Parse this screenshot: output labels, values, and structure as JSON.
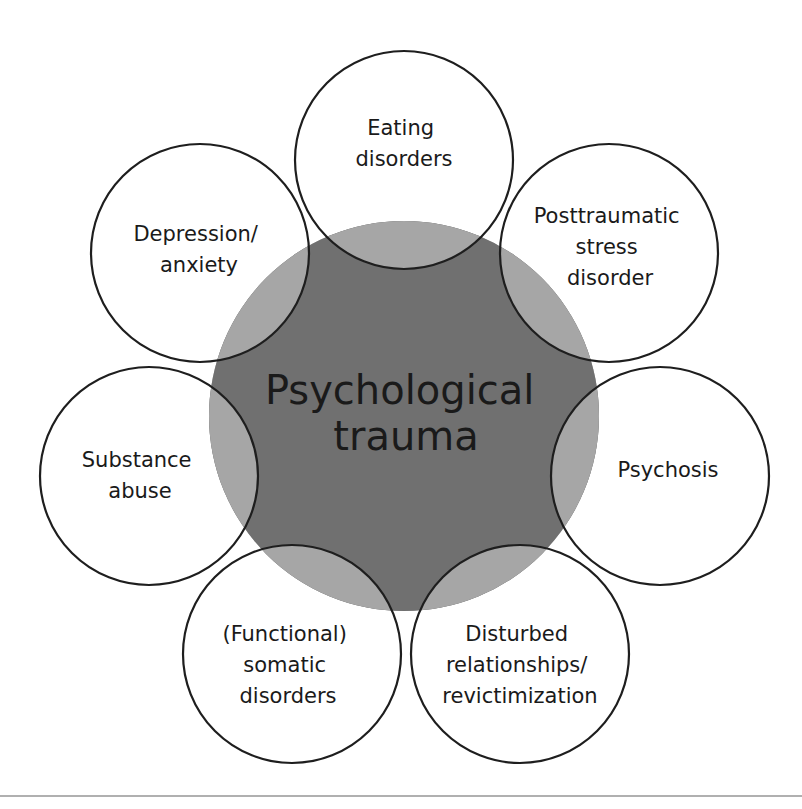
{
  "colors": {
    "background": "#ffffff",
    "core_dark": "#707070",
    "core_light": "#a6a6a6",
    "outline": "#1e1e1e",
    "rule": "#b0b0b0"
  },
  "center": {
    "lines": [
      "Psychological",
      "trauma"
    ]
  },
  "outcomes": [
    {
      "id": "eating",
      "lines": [
        "Eating",
        "disorders"
      ]
    },
    {
      "id": "ptsd",
      "lines": [
        "Posttraumatic",
        "stress",
        "disorder"
      ]
    },
    {
      "id": "psychosis",
      "lines": [
        "Psychosis"
      ]
    },
    {
      "id": "relationships",
      "lines": [
        "Disturbed",
        "relationships/",
        "revictimization"
      ]
    },
    {
      "id": "somatic",
      "lines": [
        "(Functional)",
        "somatic",
        "disorders"
      ]
    },
    {
      "id": "substance",
      "lines": [
        "Substance",
        "abuse"
      ]
    },
    {
      "id": "depression",
      "lines": [
        "Depression/",
        "anxiety"
      ]
    }
  ]
}
